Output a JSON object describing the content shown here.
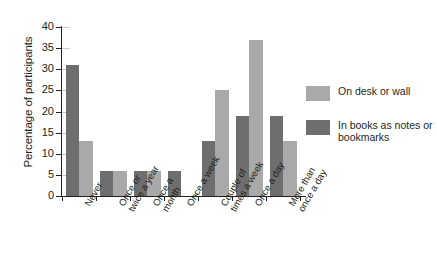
{
  "chart_data": {
    "type": "bar",
    "title": "",
    "xlabel": "",
    "ylabel": "Percentage of participants",
    "ylim": [
      0,
      40
    ],
    "yticks": [
      0,
      5,
      10,
      15,
      20,
      25,
      30,
      35,
      40
    ],
    "grid": false,
    "legend_position": "right",
    "categories": [
      "Never",
      "Once or twice a year",
      "Once a month",
      "Once a week",
      "Couple of times a week",
      "Once a day",
      "More than once a day"
    ],
    "series": [
      {
        "name": "In books as notes or bookmarks",
        "color": "#6e6e6e",
        "values": [
          31,
          6,
          6,
          6,
          13,
          19,
          19
        ]
      },
      {
        "name": "On desk or wall",
        "color": "#a9a9a9",
        "values": [
          13,
          6,
          6,
          0,
          25,
          37,
          13
        ]
      }
    ]
  },
  "axis": {
    "y_title": "Percentage of participants",
    "y_tick_labels": [
      "40",
      "35",
      "30",
      "25",
      "20",
      "15",
      "10",
      "5",
      "0"
    ],
    "x_tick_labels": [
      "Never",
      "Once or\ntwice a year",
      "Once a\nmonth",
      "Once a week",
      "Couple of\ntimes a week",
      "Once a day",
      "More than\nonce a day"
    ]
  },
  "legend": {
    "entries": [
      {
        "label": "On desk or wall",
        "color": "#a9a9a9"
      },
      {
        "label": "In books as notes or bookmarks",
        "color": "#6e6e6e"
      }
    ]
  }
}
